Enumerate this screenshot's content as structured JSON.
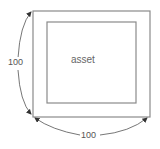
{
  "diagram": {
    "inner_box": {
      "label": "asset"
    },
    "dimensions": {
      "height": {
        "value": "100"
      },
      "width": {
        "value": "100"
      }
    },
    "colors": {
      "box_stroke": "#888888",
      "arrow": "#444444",
      "text": "#555555"
    }
  }
}
